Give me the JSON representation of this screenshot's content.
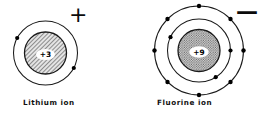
{
  "figure": {
    "background_color": "#ffffff",
    "line_color": "#1a1a1a",
    "electron_color": "#000000"
  },
  "atoms": [
    {
      "id": "lithium",
      "caption": "Lithium ion",
      "charge_sign": "+",
      "nucleus_label": "+3",
      "nucleus_fill_style": "diagonal-hatch",
      "nucleus_fill_color": "#b9b9b9",
      "center": {
        "x": 45.5,
        "y": 53
      },
      "nucleus_radius": 21,
      "shells": [
        {
          "name": "shell-1",
          "radius": 32,
          "electron_count": 2,
          "electron_angles_deg": [
            208,
            28
          ]
        }
      ]
    },
    {
      "id": "fluorine",
      "caption": "Fluorine ion",
      "charge_sign": "—",
      "nucleus_label": "+9",
      "nucleus_fill_style": "stipple",
      "nucleus_fill_color": "#a8a8a8",
      "center": {
        "x": 199,
        "y": 50.5
      },
      "nucleus_radius": 21,
      "shells": [
        {
          "name": "shell-1",
          "radius": 31.5,
          "electron_count": 3,
          "electron_angles_deg": [
            205,
            0,
            58
          ]
        },
        {
          "name": "shell-2",
          "radius": 44.5,
          "electron_count": 8,
          "electron_angles_deg": [
            270,
            315,
            0,
            45,
            90,
            135,
            180,
            225
          ]
        }
      ]
    }
  ]
}
